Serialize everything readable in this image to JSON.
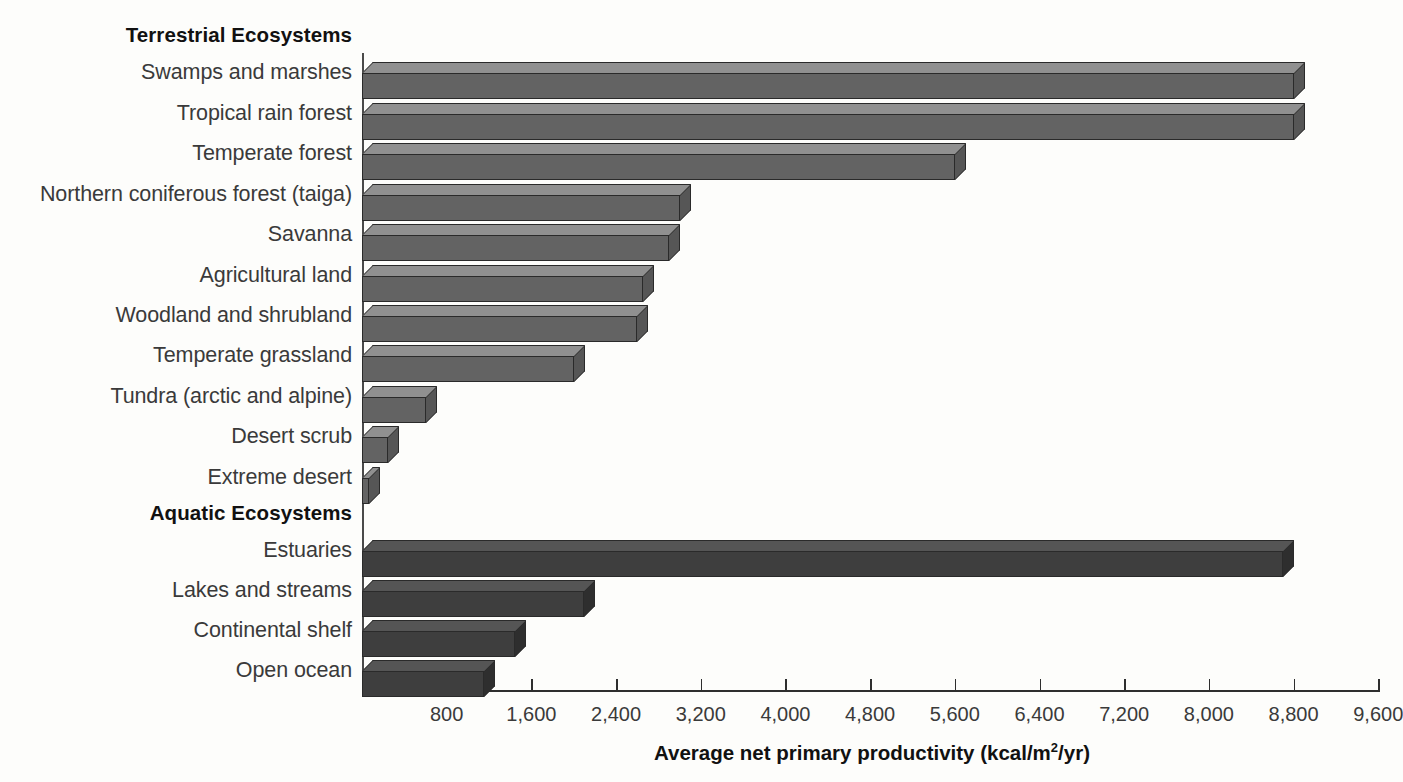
{
  "chart_data": {
    "type": "bar",
    "orientation": "horizontal",
    "title": "",
    "xlabel": "Average net primary productivity (kcal/m2/yr)",
    "xlabel_parts": {
      "pre": "Average net primary productivity (kcal/m",
      "sup": "2",
      "post": "/yr)"
    },
    "ylabel": "",
    "xlim": [
      0,
      9600
    ],
    "grid": false,
    "legend": null,
    "tick_labels": [
      "800",
      "1,600",
      "2,400",
      "3,200",
      "4,000",
      "4,800",
      "5,600",
      "6,400",
      "7,200",
      "8,000",
      "8,800",
      "9,600"
    ],
    "tick_values": [
      800,
      1600,
      2400,
      3200,
      4000,
      4800,
      5600,
      6400,
      7200,
      8000,
      8800,
      9600
    ],
    "groups": [
      {
        "name": "Terrestrial Ecosystems",
        "color": "#636363",
        "categories": [
          "Swamps and marshes",
          "Tropical rain forest",
          "Temperate forest",
          "Northern coniferous forest (taiga)",
          "Savanna",
          "Agricultural land",
          "Woodland and shrubland",
          "Temperate grassland",
          "Tundra (arctic and alpine)",
          "Desert scrub",
          "Extreme desert"
        ],
        "values": [
          8800,
          8800,
          5600,
          3000,
          2900,
          2650,
          2600,
          2000,
          600,
          250,
          70
        ]
      },
      {
        "name": "Aquatic Ecosystems",
        "color": "#3e3e3e",
        "categories": [
          "Estuaries",
          "Lakes and streams",
          "Continental shelf",
          "Open ocean"
        ],
        "values": [
          8700,
          2100,
          1450,
          1150
        ]
      }
    ]
  },
  "rows": [
    {
      "kind": "head",
      "label": "Terrestrial Ecosystems",
      "y": 25
    },
    {
      "kind": "bar",
      "label": "Swamps and marshes",
      "value": 8800,
      "group": "terr",
      "y": 62
    },
    {
      "kind": "bar",
      "label": "Tropical rain forest",
      "value": 8800,
      "group": "terr",
      "y": 103
    },
    {
      "kind": "bar",
      "label": "Temperate forest",
      "value": 5600,
      "group": "terr",
      "y": 143
    },
    {
      "kind": "bar",
      "label": "Northern coniferous forest (taiga)",
      "value": 3000,
      "group": "terr",
      "y": 184
    },
    {
      "kind": "bar",
      "label": "Savanna",
      "value": 2900,
      "group": "terr",
      "y": 224
    },
    {
      "kind": "bar",
      "label": "Agricultural land",
      "value": 2650,
      "group": "terr",
      "y": 265
    },
    {
      "kind": "bar",
      "label": "Woodland and shrubland",
      "value": 2600,
      "group": "terr",
      "y": 305
    },
    {
      "kind": "bar",
      "label": "Temperate grassland",
      "value": 2000,
      "group": "terr",
      "y": 345
    },
    {
      "kind": "bar",
      "label": "Tundra (arctic and alpine)",
      "value": 600,
      "group": "terr",
      "y": 386
    },
    {
      "kind": "bar",
      "label": "Desert scrub",
      "value": 250,
      "group": "terr",
      "y": 426
    },
    {
      "kind": "bar",
      "label": "Extreme desert",
      "value": 70,
      "group": "terr",
      "y": 467
    },
    {
      "kind": "head",
      "label": "Aquatic Ecosystems",
      "y": 503
    },
    {
      "kind": "bar",
      "label": "Estuaries",
      "value": 8700,
      "group": "aqua",
      "y": 540
    },
    {
      "kind": "bar",
      "label": "Lakes and streams",
      "value": 2100,
      "group": "aqua",
      "y": 580
    },
    {
      "kind": "bar",
      "label": "Continental shelf",
      "value": 1450,
      "group": "aqua",
      "y": 620
    },
    {
      "kind": "bar",
      "label": "Open ocean",
      "value": 1150,
      "group": "aqua",
      "y": 660
    }
  ],
  "geometry": {
    "plot_left": 362,
    "plot_top": 40,
    "px_per_unit": 0.10586,
    "bar_height": 26,
    "label_offset": -12
  }
}
